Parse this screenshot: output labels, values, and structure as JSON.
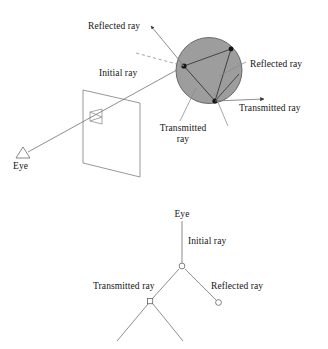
{
  "figure": {
    "colors": {
      "stroke": "#4a4a4a",
      "text": "#151515",
      "sphere_fill": "#9a9a9a",
      "sphere_stroke": "#5a5a5a",
      "node_fill": "#ffffff",
      "hit_point_fill": "#1a1a1a",
      "background": "#ffffff"
    }
  },
  "scene": {
    "name": "ray-trace-scene",
    "labels": {
      "reflected_ray_up": "Reflected ray",
      "initial_ray": "Initial ray",
      "reflected_ray_right": "Reflected ray",
      "transmitted_ray_right": "Transmitted ray",
      "transmitted_ray_down_line1": "Transmitted",
      "transmitted_ray_down_line2": "ray",
      "eye": "Eye"
    },
    "elements": {
      "sphere": "shaded-sphere",
      "image_plane": "view-plane-parallelogram",
      "pixel_cell": "pixel-quad",
      "eye_icon": "eye-triangle"
    }
  },
  "tree": {
    "name": "ray-tree",
    "labels": {
      "eye": "Eye",
      "initial_ray": "Initial ray",
      "transmitted_ray": "Transmitted ray",
      "reflected_ray": "Reflected ray"
    },
    "nodes": [
      {
        "id": "root",
        "shape": "circle",
        "label": "root-hit-node"
      },
      {
        "id": "reflected",
        "shape": "circle",
        "label": "reflected-leaf-node"
      },
      {
        "id": "transmitted",
        "shape": "square",
        "label": "transmitted-hit-node"
      }
    ]
  }
}
